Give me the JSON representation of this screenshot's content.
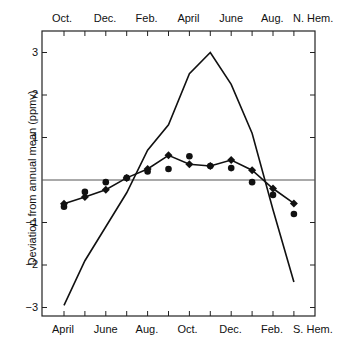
{
  "chart_data": {
    "type": "line",
    "title": "",
    "ylabel": "Deviation from annual mean (ppmv)",
    "ylim": [
      -3.4,
      3.4
    ],
    "yticks": [
      "3",
      "2",
      "1",
      "-1",
      "-2",
      "-3"
    ],
    "top_axis": {
      "labels": [
        "Oct.",
        "Dec.",
        "Feb.",
        "April",
        "June",
        "Aug."
      ],
      "hemisphere": "N. Hem."
    },
    "bottom_axis": {
      "labels": [
        "April",
        "June",
        "Aug.",
        "Oct.",
        "Dec.",
        "Feb."
      ],
      "hemisphere": "S. Hem."
    },
    "x_index": [
      0,
      1,
      2,
      3,
      4,
      5,
      6,
      7,
      8,
      9,
      10,
      11
    ],
    "series": [
      {
        "name": "Northern Hemisphere",
        "style": "line",
        "values": [
          -2.95,
          -1.9,
          -1.1,
          -0.3,
          0.7,
          1.3,
          2.5,
          3.0,
          2.25,
          1.1,
          -0.7,
          -2.4
        ]
      },
      {
        "name": "Southern Hemisphere (fitted)",
        "style": "line+diamond",
        "values": [
          -0.56,
          -0.4,
          -0.23,
          0.05,
          0.26,
          0.58,
          0.37,
          0.33,
          0.47,
          0.23,
          -0.2,
          -0.55
        ]
      },
      {
        "name": "Southern Hemisphere (observed)",
        "style": "dots",
        "values": [
          -0.63,
          -0.28,
          -0.05,
          0.05,
          0.2,
          0.26,
          0.56,
          0.33,
          0.28,
          -0.05,
          -0.35,
          -0.8
        ]
      }
    ],
    "grid": false,
    "zero_line": true
  }
}
